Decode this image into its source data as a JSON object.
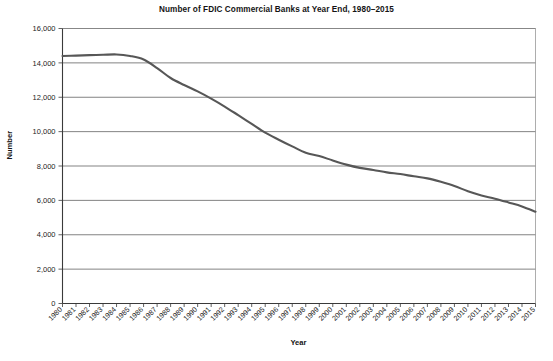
{
  "chart_data": {
    "type": "line",
    "title": "Number of FDIC Commercial Banks at Year End, 1980–2015",
    "xlabel": "Year",
    "ylabel": "Number",
    "grid": "horizontal",
    "legend": "none",
    "ylim": [
      0,
      16000
    ],
    "yticks": [
      0,
      2000,
      4000,
      6000,
      8000,
      10000,
      12000,
      14000,
      16000
    ],
    "ytick_labels": [
      "0",
      "2,000",
      "4,000",
      "6,000",
      "8,000",
      "10,000",
      "12,000",
      "14,000",
      "16,000"
    ],
    "xlim": [
      1980,
      2015
    ],
    "categories": [
      "1980",
      "1981",
      "1982",
      "1983",
      "1984",
      "1985",
      "1986",
      "1987",
      "1988",
      "1989",
      "1990",
      "1991",
      "1992",
      "1993",
      "1994",
      "1995",
      "1996",
      "1997",
      "1998",
      "1999",
      "2000",
      "2001",
      "2002",
      "2003",
      "2004",
      "2005",
      "2006",
      "2007",
      "2008",
      "2009",
      "2010",
      "2011",
      "2012",
      "2013",
      "2014",
      "2015"
    ],
    "series": [
      {
        "name": "FDIC Commercial Banks",
        "color": "#575757",
        "line_width": 2.1,
        "values": [
          14400,
          14420,
          14450,
          14470,
          14490,
          14400,
          14200,
          13700,
          13120,
          12710,
          12340,
          11920,
          11460,
          10960,
          10450,
          9940,
          9530,
          9140,
          8770,
          8580,
          8320,
          8080,
          7890,
          7770,
          7630,
          7530,
          7400,
          7280,
          7080,
          6840,
          6530,
          6290,
          6100,
          5880,
          5650,
          5340
        ]
      }
    ]
  }
}
